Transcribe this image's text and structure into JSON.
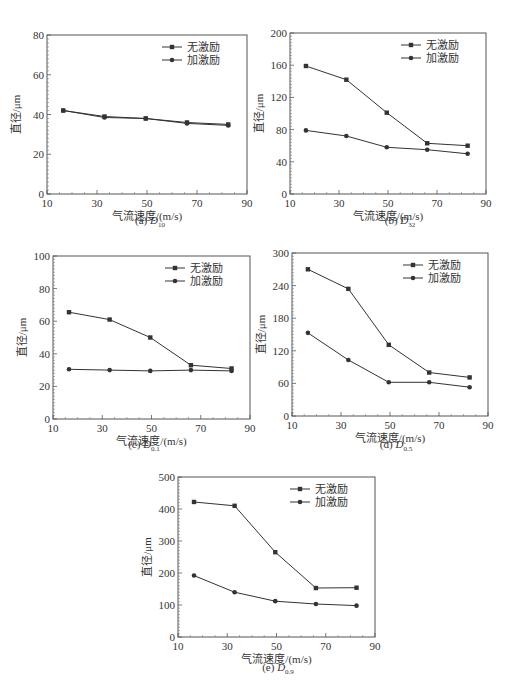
{
  "figure": {
    "legend": {
      "no_excitation": "无激励",
      "with_excitation": "加激励"
    },
    "common_xlabel": "气流速度/(m/s)",
    "common_ylabel": "直径/μm",
    "line_color": "#333333"
  },
  "chart_data": [
    {
      "id": "a",
      "type": "line",
      "caption_prefix": "(a)",
      "caption_var": "D",
      "caption_sub": "10",
      "xlabel": "气流速度/(m/s)",
      "ylabel": "直径/μm",
      "xlim": [
        10,
        90
      ],
      "ylim": [
        0,
        80
      ],
      "xticks": [
        10,
        30,
        50,
        70,
        90
      ],
      "yticks": [
        0,
        20,
        40,
        60,
        80
      ],
      "x": [
        16.5,
        33,
        49.5,
        66,
        82.5
      ],
      "series": [
        {
          "name": "无激励",
          "marker": "square",
          "values": [
            42,
            39,
            38,
            36,
            35
          ]
        },
        {
          "name": "加激励",
          "marker": "circle",
          "values": [
            42,
            38.5,
            38,
            35.5,
            34.5
          ]
        }
      ],
      "legend_position": "upper right",
      "frame": {
        "x0": 47,
        "y0": 35,
        "x1": 247,
        "y1": 194
      }
    },
    {
      "id": "b",
      "type": "line",
      "caption_prefix": "(b)",
      "caption_var": "D",
      "caption_sub": "32",
      "xlabel": "气流速度/(m/s)",
      "ylabel": "直径/μm",
      "xlim": [
        10,
        90
      ],
      "ylim": [
        0,
        200
      ],
      "xticks": [
        10,
        30,
        50,
        70,
        90
      ],
      "yticks": [
        0,
        40,
        80,
        120,
        160,
        200
      ],
      "x": [
        16.5,
        33,
        49.5,
        66,
        82.5
      ],
      "series": [
        {
          "name": "无激励",
          "marker": "square",
          "values": [
            159,
            142,
            101,
            63,
            60
          ]
        },
        {
          "name": "加激励",
          "marker": "circle",
          "values": [
            79,
            72,
            58,
            55,
            50
          ]
        }
      ],
      "legend_position": "upper right",
      "frame": {
        "x0": 290,
        "y0": 33,
        "x1": 486,
        "y1": 194
      }
    },
    {
      "id": "c",
      "type": "line",
      "caption_prefix": "(c)",
      "caption_var": "D",
      "caption_sub": "0.1",
      "xlabel": "气流速度/(m/s)",
      "ylabel": "直径/μm",
      "xlim": [
        10,
        90
      ],
      "ylim": [
        0,
        100
      ],
      "xticks": [
        10,
        30,
        50,
        70,
        90
      ],
      "yticks": [
        0,
        20,
        40,
        60,
        80,
        100
      ],
      "x": [
        16.5,
        33,
        49.5,
        66,
        82.5
      ],
      "series": [
        {
          "name": "无激励",
          "marker": "square",
          "values": [
            65.5,
            61,
            50,
            33,
            31
          ]
        },
        {
          "name": "加激励",
          "marker": "circle",
          "values": [
            30.5,
            30,
            29.5,
            30,
            29.5
          ]
        }
      ],
      "legend_position": "upper right",
      "frame": {
        "x0": 53,
        "y0": 256,
        "x1": 250,
        "y1": 419
      }
    },
    {
      "id": "d",
      "type": "line",
      "caption_prefix": "(d)",
      "caption_var": "D",
      "caption_sub": "0.5",
      "xlabel": "气流速度/(m/s)",
      "ylabel": "直径/μm",
      "xlim": [
        10,
        90
      ],
      "ylim": [
        0,
        300
      ],
      "xticks": [
        10,
        30,
        50,
        70,
        90
      ],
      "yticks": [
        0,
        60,
        120,
        180,
        240,
        300
      ],
      "x": [
        16.5,
        33,
        49.5,
        66,
        82.5
      ],
      "series": [
        {
          "name": "无激励",
          "marker": "square",
          "values": [
            270,
            234,
            131,
            80,
            71
          ]
        },
        {
          "name": "加激励",
          "marker": "circle",
          "values": [
            153,
            103,
            62,
            62,
            53
          ]
        }
      ],
      "legend_position": "upper right",
      "frame": {
        "x0": 292,
        "y0": 253,
        "x1": 488,
        "y1": 416
      }
    },
    {
      "id": "e",
      "type": "line",
      "caption_prefix": "(e)",
      "caption_var": "D",
      "caption_sub": "0.9",
      "xlabel": "气流速度/(m/s)",
      "ylabel": "直径/μm",
      "xlim": [
        10,
        90
      ],
      "ylim": [
        0,
        500
      ],
      "xticks": [
        10,
        30,
        50,
        70,
        90
      ],
      "yticks": [
        0,
        100,
        200,
        300,
        400,
        500
      ],
      "x": [
        16.5,
        33,
        49.5,
        66,
        82.5
      ],
      "series": [
        {
          "name": "无激励",
          "marker": "square",
          "values": [
            422,
            410,
            265,
            153,
            154
          ]
        },
        {
          "name": "加激励",
          "marker": "circle",
          "values": [
            192,
            140,
            112,
            103,
            98
          ]
        }
      ],
      "legend_position": "upper right",
      "frame": {
        "x0": 178,
        "y0": 477,
        "x1": 375,
        "y1": 637
      }
    }
  ]
}
